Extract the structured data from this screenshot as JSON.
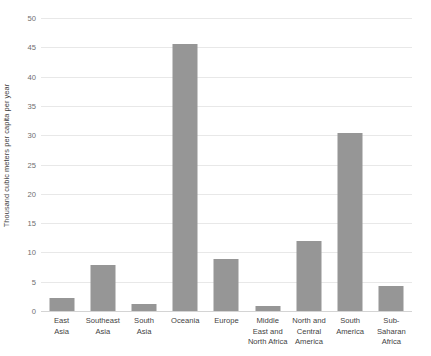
{
  "chart_data": {
    "type": "bar",
    "title": "",
    "xlabel": "",
    "ylabel": "Thousand cubic meters per capita per year",
    "ylim": [
      0,
      50
    ],
    "ytick_step": 5,
    "yticks": [
      "0",
      "5",
      "10",
      "15",
      "20",
      "25",
      "30",
      "35",
      "40",
      "45",
      "50"
    ],
    "grid": true,
    "legend": false,
    "bar_color": "#969696",
    "grid_color": "#e8e8e8",
    "categories": [
      "East Asia",
      "Southeast Asia",
      "South Asia",
      "Oceania",
      "Europe",
      "Middle East and North Africa",
      "North and Central America",
      "South America",
      "Sub-Saharan Africa"
    ],
    "category_lines": [
      [
        "East",
        "Asia"
      ],
      [
        "Southeast",
        "Asia"
      ],
      [
        "South",
        "Asia"
      ],
      [
        "Oceania"
      ],
      [
        "Europe"
      ],
      [
        "Middle",
        "East and",
        "North Africa"
      ],
      [
        "North and",
        "Central",
        "America"
      ],
      [
        "South",
        "America"
      ],
      [
        "Sub-",
        "Saharan",
        "Africa"
      ]
    ],
    "values": [
      2.2,
      7.9,
      1.2,
      45.5,
      8.9,
      0.9,
      12.0,
      30.4,
      4.2
    ]
  }
}
